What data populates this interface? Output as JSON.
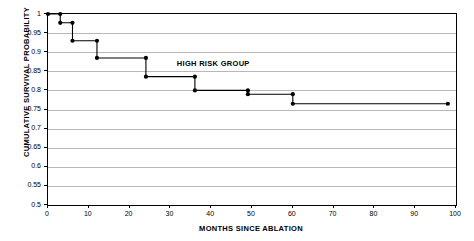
{
  "chart_data": {
    "type": "line",
    "subtype": "kaplan-meier-step",
    "title": "",
    "xlabel": "MONTHS SINCE ABLATION",
    "ylabel": "CUMULATIVE SURVIVAL PROBABILITY",
    "xlim": [
      0,
      100
    ],
    "ylim": [
      0.5,
      1.0
    ],
    "xticks": [
      0,
      10,
      20,
      30,
      40,
      50,
      60,
      70,
      80,
      90,
      100
    ],
    "xtick_labels": [
      "0",
      "10",
      "20",
      "30",
      "40",
      "50",
      "60",
      "70",
      "80",
      "90",
      "100"
    ],
    "yticks": [
      0.5,
      0.55,
      0.6,
      0.65,
      0.7,
      0.75,
      0.8,
      0.85,
      0.9,
      0.95,
      1
    ],
    "ytick_labels": [
      "0.5",
      "0.55",
      "0.6",
      "0.65",
      "0.7",
      "0.75",
      "0.8",
      "0.85",
      "0.9",
      "0.95",
      "1"
    ],
    "grid": {
      "horizontal": true,
      "vertical": false,
      "color": "#b8b8b8"
    },
    "legend": {
      "visible": false,
      "position": "none"
    },
    "annotations": [
      {
        "text": "HIGH RISK GROUP",
        "x": 40.5,
        "y": 0.873,
        "bold": true
      }
    ],
    "series": [
      {
        "name": "HIGH RISK GROUP",
        "color": "#000000",
        "marker": "filled-circle",
        "x": [
          0,
          3,
          3,
          6,
          6,
          12,
          12,
          24,
          24,
          36,
          36,
          49,
          49,
          60,
          60,
          98
        ],
        "y": [
          1.0,
          1.0,
          0.977,
          0.977,
          0.93,
          0.93,
          0.885,
          0.885,
          0.836,
          0.836,
          0.8,
          0.8,
          0.79,
          0.79,
          0.765,
          0.765
        ],
        "points": [
          {
            "x": 0,
            "y": 1.0
          },
          {
            "x": 3,
            "y": 1.0
          },
          {
            "x": 3,
            "y": 0.977
          },
          {
            "x": 6,
            "y": 0.977
          },
          {
            "x": 6,
            "y": 0.93
          },
          {
            "x": 12,
            "y": 0.93
          },
          {
            "x": 12,
            "y": 0.885
          },
          {
            "x": 24,
            "y": 0.885
          },
          {
            "x": 24,
            "y": 0.836
          },
          {
            "x": 36,
            "y": 0.836
          },
          {
            "x": 36,
            "y": 0.8
          },
          {
            "x": 49,
            "y": 0.8
          },
          {
            "x": 49,
            "y": 0.79
          },
          {
            "x": 60,
            "y": 0.79
          },
          {
            "x": 60,
            "y": 0.765
          },
          {
            "x": 98,
            "y": 0.765
          }
        ]
      }
    ]
  },
  "geometry": {
    "plot_left": 47,
    "plot_top": 13,
    "plot_right": 455,
    "plot_bottom": 204
  }
}
